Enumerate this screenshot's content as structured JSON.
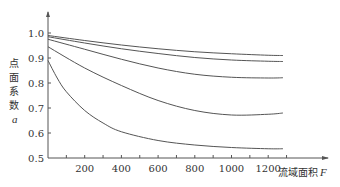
{
  "chart_data": {
    "type": "line",
    "title": "",
    "xlabel": "流域面积",
    "xlabel_var": "F",
    "ylabel_chars": [
      "点",
      "面",
      "系",
      "数"
    ],
    "ylabel_var": "a",
    "xlim": [
      0,
      1350
    ],
    "ylim": [
      0.5,
      1.06
    ],
    "x_ticks": [
      200,
      400,
      600,
      800,
      1000,
      1200
    ],
    "x_minor_ticks": [
      100,
      300,
      500,
      700,
      900,
      1100,
      1300
    ],
    "y_ticks": [
      0.5,
      0.6,
      0.7,
      0.8,
      0.9,
      1.0
    ],
    "y_tick_labels": [
      "0.5",
      "0.6",
      "0.7",
      "0.8",
      "0.9",
      "1.0"
    ],
    "grid": false,
    "legend": null,
    "series": [
      {
        "name": "curve-1",
        "x": [
          0,
          200,
          400,
          600,
          800,
          1000,
          1200,
          1280
        ],
        "y": [
          0.99,
          0.97,
          0.952,
          0.937,
          0.925,
          0.917,
          0.911,
          0.91
        ]
      },
      {
        "name": "curve-2",
        "x": [
          0,
          200,
          400,
          600,
          800,
          1000,
          1200,
          1280
        ],
        "y": [
          0.985,
          0.96,
          0.937,
          0.918,
          0.902,
          0.892,
          0.887,
          0.886
        ]
      },
      {
        "name": "curve-3",
        "x": [
          0,
          200,
          400,
          600,
          800,
          1000,
          1200,
          1280
        ],
        "y": [
          0.975,
          0.935,
          0.895,
          0.86,
          0.835,
          0.823,
          0.82,
          0.821
        ]
      },
      {
        "name": "curve-4",
        "x": [
          0,
          200,
          400,
          600,
          800,
          1000,
          1200,
          1280
        ],
        "y": [
          0.945,
          0.86,
          0.79,
          0.73,
          0.69,
          0.672,
          0.675,
          0.68
        ]
      },
      {
        "name": "curve-5",
        "x": [
          0,
          50,
          100,
          200,
          300,
          400,
          600,
          800,
          1000,
          1200,
          1280
        ],
        "y": [
          0.89,
          0.82,
          0.765,
          0.69,
          0.64,
          0.605,
          0.57,
          0.552,
          0.542,
          0.537,
          0.537
        ]
      }
    ]
  }
}
